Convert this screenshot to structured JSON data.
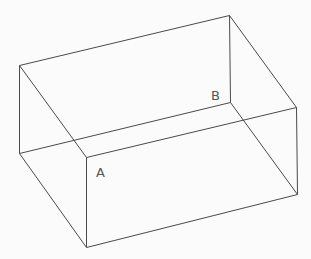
{
  "diagram": {
    "type": "3d-box-wireframe",
    "labels": [
      {
        "id": "A",
        "text": "A",
        "vertex": "front_top_left"
      },
      {
        "id": "B",
        "text": "B",
        "vertex": "back_bottom_right"
      }
    ],
    "vertices": [
      "back_top_left",
      "back_top_right",
      "back_bottom_left",
      "back_bottom_right",
      "front_top_left",
      "front_top_right",
      "front_bottom_left",
      "front_bottom_right"
    ],
    "edges": [
      [
        "back_top_left",
        "back_top_right"
      ],
      [
        "back_top_left",
        "back_bottom_left"
      ],
      [
        "back_top_right",
        "back_bottom_right"
      ],
      [
        "back_bottom_left",
        "back_bottom_right"
      ],
      [
        "back_top_left",
        "front_top_left"
      ],
      [
        "back_top_right",
        "front_top_right"
      ],
      [
        "back_bottom_left",
        "front_bottom_left"
      ],
      [
        "back_bottom_right",
        "front_bottom_right"
      ],
      [
        "front_top_left",
        "front_top_right"
      ],
      [
        "front_top_left",
        "front_bottom_left"
      ],
      [
        "front_top_right",
        "front_bottom_right"
      ],
      [
        "front_bottom_left",
        "front_bottom_right"
      ]
    ],
    "line_color": "#4a4a4a",
    "label_color": "#555555"
  }
}
